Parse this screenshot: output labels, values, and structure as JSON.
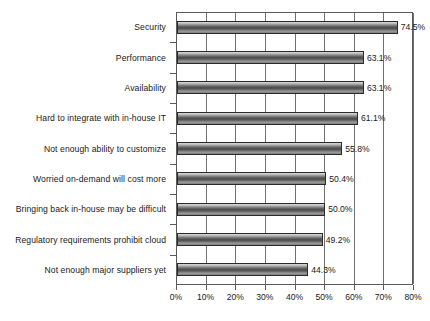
{
  "chart_data": {
    "type": "bar",
    "orientation": "horizontal",
    "title": "",
    "subtitle": "",
    "xlabel": "",
    "ylabel": "",
    "xlim": [
      0,
      80
    ],
    "xtick_labels": [
      "0%",
      "10%",
      "20%",
      "30%",
      "40%",
      "50%",
      "60%",
      "70%",
      "80%"
    ],
    "xtick_values": [
      0,
      10,
      20,
      30,
      40,
      50,
      60,
      70,
      80
    ],
    "grid": true,
    "legend": false,
    "categories": [
      "Security",
      "Performance",
      "Availability",
      "Hard to integrate with in-house IT",
      "Not enough ability to customize",
      "Worried on-demand will cost more",
      "Bringing back in-house may be difficult",
      "Regulatory requirements prohibit cloud",
      "Not enough major suppliers yet"
    ],
    "values": [
      74.5,
      63.1,
      63.1,
      61.1,
      55.8,
      50.4,
      50.0,
      49.2,
      44.3
    ],
    "data_labels": [
      "74.5%",
      "63.1%",
      "63.1%",
      "61.1%",
      "55.8%",
      "50.4%",
      "50.0%",
      "49.2%",
      "44.3%"
    ],
    "colors": {
      "bar_fill_light": "#d8d8d8",
      "bar_fill_dark": "#494949",
      "bar_outline": "#2b2b2b",
      "gridline": "#707070",
      "axis": "#5a5a5a",
      "text": "#1a1a1a",
      "background": "#ffffff"
    }
  }
}
